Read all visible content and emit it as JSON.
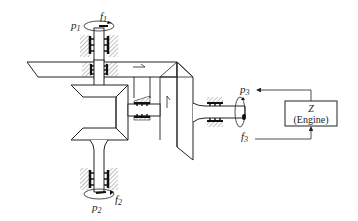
{
  "diagram": {
    "type": "mechanical-schematic",
    "ports": [
      {
        "id": "port-1",
        "effort": "p",
        "effort_sub": "1",
        "flow": "f",
        "flow_sub": "1",
        "position": "top shaft"
      },
      {
        "id": "port-2",
        "effort": "p",
        "effort_sub": "2",
        "flow": "f",
        "flow_sub": "2",
        "position": "bottom shaft"
      },
      {
        "id": "port-3",
        "effort": "p",
        "effort_sub": "3",
        "flow": "f",
        "flow_sub": "3",
        "position": "right shaft"
      }
    ],
    "engine_block": {
      "symbol": "Z",
      "label": "(Engine)"
    },
    "colors": {
      "line": "#222222",
      "background": "#ffffff",
      "hatch": "#555555"
    }
  }
}
